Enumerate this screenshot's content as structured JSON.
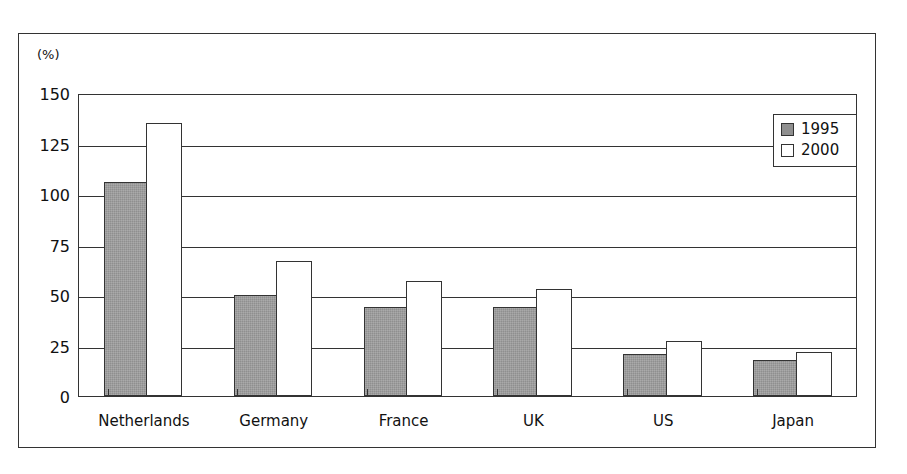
{
  "chart_data": {
    "type": "bar",
    "title": "",
    "subtitle": "",
    "xlabel": "",
    "ylabel": "",
    "unit_label": "(%)",
    "categories": [
      "Netherlands",
      "Germany",
      "France",
      "UK",
      "US",
      "Japan"
    ],
    "series": [
      {
        "name": "1995",
        "color": "#8f8f8f",
        "values": [
          106,
          50,
          44,
          44,
          21,
          18
        ]
      },
      {
        "name": "2000",
        "color": "#ffffff",
        "values": [
          135,
          67,
          57,
          53,
          27,
          22
        ]
      }
    ],
    "ylim": [
      0,
      150
    ],
    "yticks": [
      0,
      25,
      50,
      75,
      100,
      125,
      150
    ],
    "ytick_labels": [
      "0",
      "25",
      "50",
      "75",
      "100",
      "125",
      "150"
    ],
    "grid": "horizontal",
    "legend_position": "top-right"
  }
}
